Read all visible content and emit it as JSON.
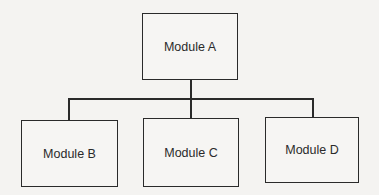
{
  "diagram": {
    "type": "hierarchy",
    "root": {
      "label": "Module A"
    },
    "children": [
      {
        "label": "Module B"
      },
      {
        "label": "Module C"
      },
      {
        "label": "Module D"
      }
    ]
  }
}
